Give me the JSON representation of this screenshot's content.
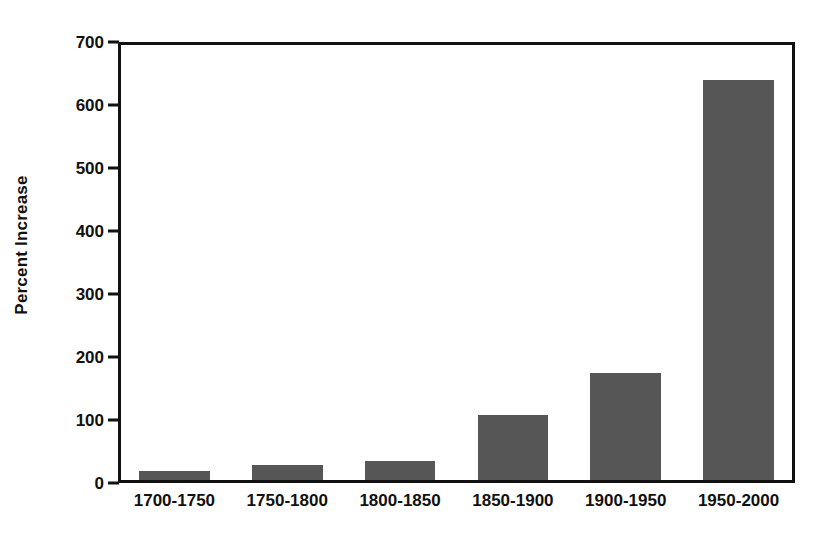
{
  "chart_data": {
    "type": "bar",
    "title": "",
    "subtitle": "",
    "xlabel": "",
    "ylabel": "Percent Increase",
    "categories": [
      "1700-1750",
      "1750-1800",
      "1800-1850",
      "1850-1900",
      "1900-1950",
      "1950-2000"
    ],
    "values": [
      14,
      24,
      30,
      103,
      170,
      635
    ],
    "series": [
      {
        "name": "Percent Increase",
        "values": [
          14,
          24,
          30,
          103,
          170,
          635
        ]
      }
    ],
    "ylim": [
      0,
      700
    ],
    "xlim": [
      0,
      6
    ],
    "y_ticks": [
      0,
      100,
      200,
      300,
      400,
      500,
      600,
      700
    ],
    "y_tick_labels": [
      "0",
      "100",
      "200",
      "300",
      "400",
      "500",
      "600",
      "700"
    ],
    "grid": false,
    "legend": false,
    "legend_position": "none",
    "annotations": [],
    "colors": {
      "bar_fill": "#565656",
      "axis": "#111111",
      "text": "#111111",
      "background": "#ffffff"
    }
  }
}
